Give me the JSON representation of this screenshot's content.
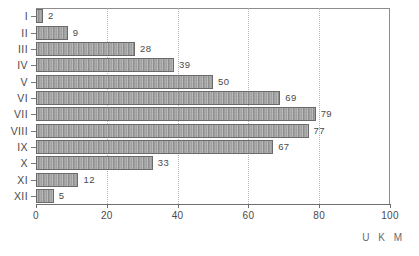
{
  "chart_data": {
    "type": "bar",
    "orientation": "horizontal",
    "title": "",
    "xlabel": "U K M",
    "ylabel": "",
    "categories": [
      "I",
      "II",
      "III",
      "IV",
      "V",
      "VI",
      "VII",
      "VIII",
      "IX",
      "X",
      "XI",
      "XII"
    ],
    "values": [
      2,
      9,
      28,
      39,
      50,
      69,
      79,
      77,
      67,
      33,
      12,
      5
    ],
    "value_labels": [
      "2",
      "9",
      "28",
      "39",
      "50",
      "69",
      "79",
      "77",
      "67",
      "33",
      "12",
      "5"
    ],
    "xlim": [
      0,
      100
    ],
    "xticks": [
      0,
      20,
      40,
      60,
      80,
      100
    ],
    "xtick_labels": [
      "0",
      "20",
      "40",
      "60",
      "80",
      "100"
    ],
    "grid": true,
    "grid_axis": "x",
    "grid_style": "dotted",
    "legend": false,
    "bar_fill": "#9a9a9a",
    "bar_border": "#6a6a6a",
    "axis_color": "#6f6f6f",
    "grid_color": "#b4b4b4",
    "text_color": "#4a4a4a",
    "background": "#ffffff"
  },
  "caption": {
    "axis_unit": "U K M"
  }
}
